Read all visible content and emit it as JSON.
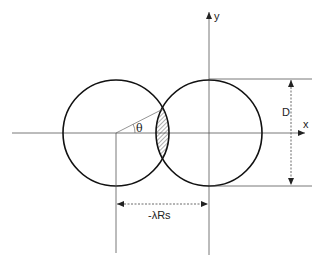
{
  "diagram": {
    "labels": {
      "y_axis": "y",
      "x_axis": "x",
      "theta": "θ",
      "diameter": "D",
      "separation": "-λRs"
    },
    "elements": {
      "left_circle": {
        "cx": 116,
        "cy": 133,
        "r": 53
      },
      "right_circle": {
        "cx": 209,
        "cy": 133,
        "r": 53
      },
      "overlap_region": "hatched lens"
    },
    "colors": {
      "stroke": "#111111",
      "thin_line": "#444444",
      "background": "#ffffff"
    }
  }
}
